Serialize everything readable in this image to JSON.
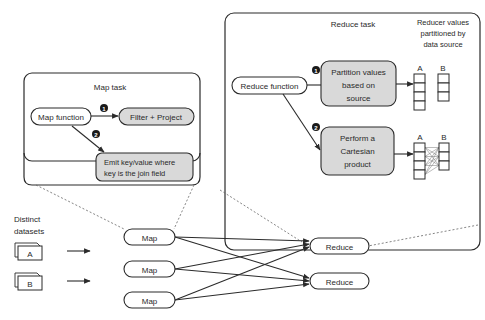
{
  "left_labels": {
    "distinct_line1": "Distinct",
    "distinct_line2": "datasets",
    "dataset_a": "A",
    "dataset_b": "B"
  },
  "map_task": {
    "title": "Map task",
    "function_label": "Map function",
    "step1_badge": "1",
    "step1_label": "Filter + Project",
    "step2_badge": "2",
    "step2_line1": "Emit key/value where",
    "step2_line2": "key is the join field"
  },
  "reduce_task": {
    "title": "Reduce task",
    "values_header_line1": "Reducer values",
    "values_header_line2": "partitioned by",
    "values_header_line3": "data source",
    "function_label": "Reduce function",
    "step1_badge": "1",
    "step1_line1": "Partition values",
    "step1_line2": "based on",
    "step1_line3": "source",
    "step2_badge": "2",
    "step2_line1": "Perform a",
    "step2_line2": "Cartesian",
    "step2_line3": "product",
    "col_a": "A",
    "col_b": "B"
  },
  "pipeline": {
    "map_nodes": [
      "Map",
      "Map",
      "Map"
    ],
    "reduce_nodes": [
      "Reduce",
      "Reduce"
    ]
  },
  "colors": {
    "stroke": "#2b2b2b",
    "shaded_box": "#d9d9d9",
    "dashed": "#666666"
  }
}
